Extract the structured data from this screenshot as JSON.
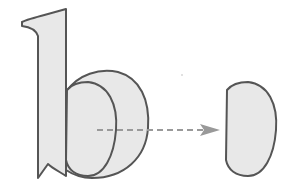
{
  "diagram": {
    "letter": "b",
    "colors": {
      "background": "#ffffff",
      "fill": "#e8e8e8",
      "stroke": "#555555",
      "arrow": "#999999"
    }
  }
}
